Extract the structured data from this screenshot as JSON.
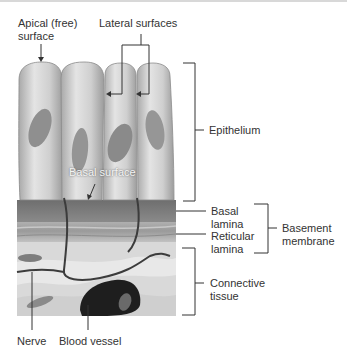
{
  "labels": {
    "apical": "Apical (free)\nsurface",
    "lateral": "Lateral surfaces",
    "basal_surface": "Basal surface",
    "epithelium": "Epithelium",
    "basal_lamina": "Basal\nlamina",
    "reticular_lamina": "Reticular\nlamina",
    "basement_membrane": "Basement\nmembrane",
    "connective_tissue": "Connective\ntissue",
    "nerve": "Nerve",
    "blood_vessel": "Blood vessel"
  },
  "colors": {
    "cell_fill": "#c9c9c9",
    "cell_highlight": "#e6e6e6",
    "nucleus": "#8f8f8f",
    "basal_band": "#7a7a7a",
    "reticular_band": "#a8a8a8",
    "connective": "#d6d6d6",
    "vessel": "#1e1e1e",
    "line": "#333333",
    "text": "#333333"
  }
}
